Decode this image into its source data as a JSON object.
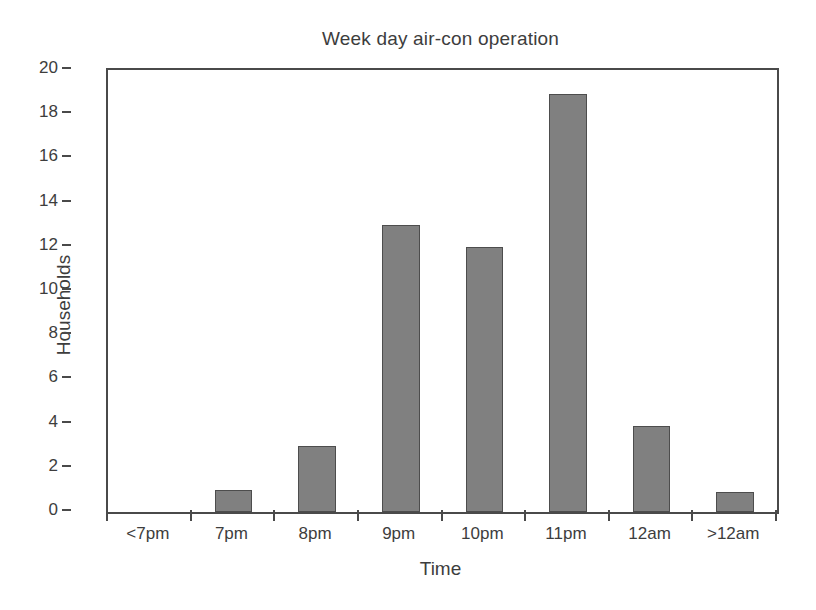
{
  "chart_data": {
    "type": "bar",
    "title": "Week day air-con operation",
    "xlabel": "Time",
    "ylabel": "Households",
    "categories": [
      "<7pm",
      "7pm",
      "8pm",
      "9pm",
      "10pm",
      "11pm",
      "12am",
      ">12am"
    ],
    "values": [
      0,
      1,
      3,
      13,
      12,
      18.9,
      3.9,
      0.9
    ],
    "ylim": [
      0,
      20
    ],
    "ytick_labels": [
      "20",
      "18",
      "16",
      "14",
      "12",
      "10",
      "8",
      "6",
      "4",
      "2",
      "0"
    ],
    "ytick_values": [
      20,
      18,
      16,
      14,
      12,
      10,
      8,
      6,
      4,
      2,
      0
    ],
    "grid": false,
    "legend": false,
    "bar_color": "#808080",
    "bar_edge_color": "#4d4d4d",
    "axis_color": "#4a4a4a",
    "text_color": "#3d3d3d",
    "background": "#ffffff"
  }
}
